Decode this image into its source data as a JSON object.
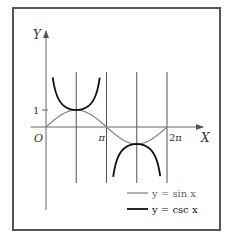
{
  "chart_data": {
    "type": "line",
    "title": "",
    "xlabel": "X",
    "ylabel": "Y",
    "origin_label": "O",
    "x_ticks": [
      {
        "value": 3.14159,
        "label": "π"
      },
      {
        "value": 6.28319,
        "label": "2π"
      }
    ],
    "y_ticks": [
      {
        "value": 1,
        "label": "1"
      }
    ],
    "xlim": [
      -0.8,
      8.4
    ],
    "ylim": [
      -4.9,
      5.5
    ],
    "vertical_lines": [
      1.5708,
      3.14159,
      4.71239,
      6.28319
    ],
    "series": [
      {
        "name": "y = sin x",
        "legend_label": "y = sin x",
        "color": "#888888",
        "function": "sin",
        "domain": [
          0,
          6.28319
        ],
        "x": [
          0,
          0.785,
          1.571,
          2.356,
          3.142,
          3.927,
          4.712,
          5.498,
          6.283
        ],
        "values": [
          0,
          0.71,
          1,
          0.71,
          0,
          -0.71,
          -1,
          -0.71,
          0
        ]
      },
      {
        "name": "y = csc x",
        "legend_label": "y = csc x",
        "color": "#111111",
        "function": "csc",
        "branches": [
          [
            0.35,
            2.79
          ],
          [
            3.49,
            5.93
          ]
        ],
        "x": [
          0.35,
          0.785,
          1.571,
          2.356,
          2.79,
          3.49,
          3.927,
          4.712,
          5.498,
          5.93
        ],
        "values": [
          2.92,
          1.41,
          1,
          1.41,
          2.92,
          -2.92,
          -1.41,
          -1,
          -1.41,
          -2.92
        ]
      }
    ],
    "legend_position": "lower right",
    "grid": false
  },
  "legend": {
    "items": [
      {
        "label": "y = sin x",
        "color": "#888888"
      },
      {
        "label": "y = csc x",
        "color": "#111111"
      }
    ]
  }
}
